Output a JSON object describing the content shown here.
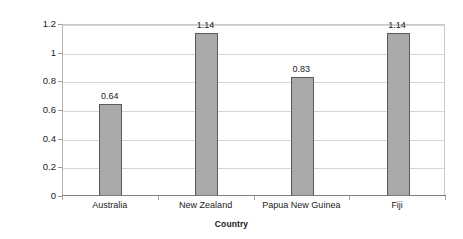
{
  "chart_data": {
    "type": "bar",
    "title": "",
    "categories": [
      "Australia",
      "New Zealand",
      "Papua New Guinea",
      "Fiji"
    ],
    "values": [
      0.64,
      1.14,
      0.83,
      1.14
    ],
    "value_labels": [
      "0.64",
      "1.14",
      "0.83",
      "1.14"
    ],
    "xlabel": "Country",
    "ylabel": "Sedimentation rates (%/year)",
    "ylim": [
      0,
      1.2
    ],
    "ytick_step": 0.2,
    "ytick_labels": [
      "0",
      "0.2",
      "0.4",
      "0.6",
      "0.8",
      "1",
      "1.2"
    ],
    "grid": true,
    "legend": false,
    "bar_fill_color": "#a9a9a9",
    "bar_border_color": "#595959",
    "gridline_color": "#d6d6d6",
    "background_color": "#ffffff"
  }
}
